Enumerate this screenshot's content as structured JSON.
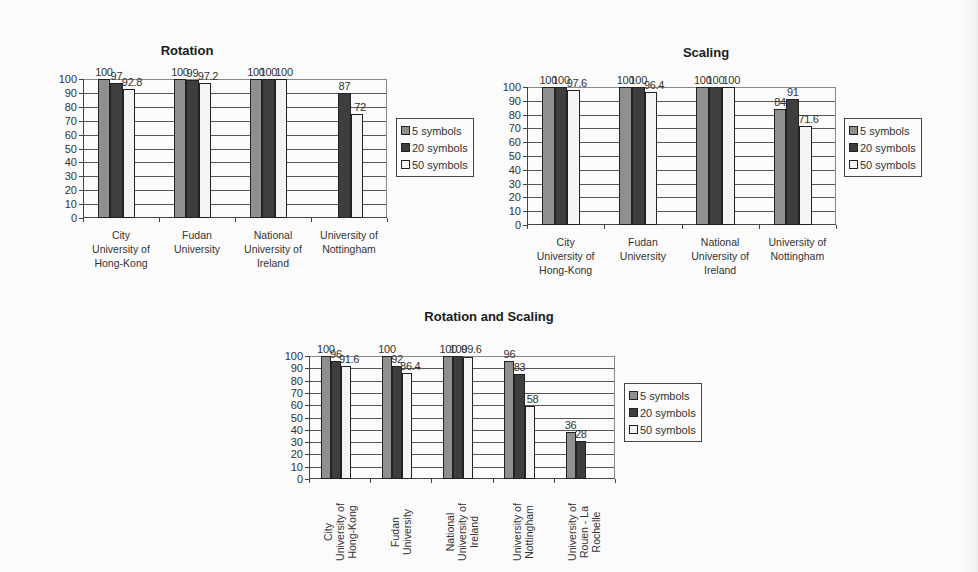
{
  "page": {
    "background": "#fbfbfb"
  },
  "series_colors": {
    "5 symbols": "#8f8f8f",
    "20 symbols": "#3e3e3e",
    "50 symbols": "#f4f4f4"
  },
  "chart_data": [
    {
      "id": "rotation",
      "type": "bar",
      "title": "Rotation",
      "xlabel": "",
      "ylabel": "",
      "ylim": [
        0,
        100
      ],
      "yticks": [
        0,
        10,
        20,
        30,
        40,
        50,
        60,
        70,
        80,
        90,
        100
      ],
      "grid": true,
      "legend_position": "right",
      "categories": [
        "City University of Hong-Kong",
        "Fudan University",
        "National University of Ireland",
        "University of Nottingham"
      ],
      "category_label_lines": [
        [
          "City",
          "University of",
          "Hong-Kong"
        ],
        [
          "Fudan",
          "University"
        ],
        [
          "National",
          "University of",
          "Ireland"
        ],
        [
          "University of",
          "Nottingham"
        ]
      ],
      "series": [
        {
          "name": "5 symbols",
          "values": [
            100,
            100,
            100,
            null
          ],
          "labels": [
            "100",
            "100",
            "100",
            ""
          ]
        },
        {
          "name": "20 symbols",
          "values": [
            97,
            99,
            100,
            90
          ],
          "labels": [
            "97",
            "99",
            "100",
            "87"
          ]
        },
        {
          "name": "50 symbols",
          "values": [
            92.8,
            97.2,
            100,
            75
          ],
          "labels": [
            "92.8",
            "97.2",
            "100",
            "72"
          ]
        }
      ],
      "layout": {
        "title_x": 187,
        "title_y": 43,
        "plot_left": 83,
        "plot_top": 79,
        "plot_width": 304,
        "plot_height": 139,
        "legend_left": 396,
        "legend_top": 118,
        "rotated_labels": false
      }
    },
    {
      "id": "scaling",
      "type": "bar",
      "title": "Scaling",
      "xlabel": "",
      "ylabel": "",
      "ylim": [
        0,
        100
      ],
      "yticks": [
        0,
        10,
        20,
        30,
        40,
        50,
        60,
        70,
        80,
        90,
        100
      ],
      "grid": true,
      "legend_position": "right",
      "categories": [
        "City University of Hong-Kong",
        "Fudan University",
        "National University of Ireland",
        "University of Nottingham"
      ],
      "category_label_lines": [
        [
          "City",
          "University of",
          "Hong-Kong"
        ],
        [
          "Fudan",
          "University"
        ],
        [
          "National",
          "University of",
          "Ireland"
        ],
        [
          "University of",
          "Nottingham"
        ]
      ],
      "series": [
        {
          "name": "5 symbols",
          "values": [
            100,
            100,
            100,
            84
          ],
          "labels": [
            "100",
            "100",
            "100",
            "84"
          ]
        },
        {
          "name": "20 symbols",
          "values": [
            100,
            100,
            100,
            91
          ],
          "labels": [
            "100",
            "100",
            "100",
            "91"
          ]
        },
        {
          "name": "50 symbols",
          "values": [
            97.6,
            96.4,
            100,
            71.6
          ],
          "labels": [
            "97.6",
            "96.4",
            "100",
            "71.6"
          ]
        }
      ],
      "layout": {
        "title_x": 706,
        "title_y": 45,
        "plot_left": 527,
        "plot_top": 87,
        "plot_width": 309,
        "plot_height": 138,
        "legend_left": 844,
        "legend_top": 118,
        "rotated_labels": false
      }
    },
    {
      "id": "rotation-and-scaling",
      "type": "bar",
      "title": "Rotation and Scaling",
      "xlabel": "",
      "ylabel": "",
      "ylim": [
        0,
        100
      ],
      "yticks": [
        0,
        10,
        20,
        30,
        40,
        50,
        60,
        70,
        80,
        90,
        100
      ],
      "grid": true,
      "legend_position": "right",
      "categories": [
        "City University of Hong-Kong",
        "Fudan University",
        "National University of Ireland",
        "University of Nottingham",
        "University of Rouen - La Rochelle"
      ],
      "category_label_lines": [
        [
          "City",
          "University of",
          "Hong-Kong"
        ],
        [
          "Fudan",
          "University"
        ],
        [
          "National",
          "University of",
          "Ireland"
        ],
        [
          "University of",
          "Nottingham"
        ],
        [
          "University of",
          "Rouen - La",
          "Rochelle"
        ]
      ],
      "series": [
        {
          "name": "5 symbols",
          "values": [
            100,
            100,
            100,
            96,
            38
          ],
          "labels": [
            "100",
            "100",
            "100",
            "96",
            "36"
          ]
        },
        {
          "name": "20 symbols",
          "values": [
            96,
            92,
            100,
            85,
            31
          ],
          "labels": [
            "96",
            "92",
            "100",
            "83",
            "28"
          ]
        },
        {
          "name": "50 symbols",
          "values": [
            91.6,
            86.4,
            99.6,
            59,
            null
          ],
          "labels": [
            "91.6",
            "86.4",
            "99.6",
            "58",
            ""
          ]
        }
      ],
      "layout": {
        "title_x": 489,
        "title_y": 309,
        "plot_left": 309,
        "plot_top": 356,
        "plot_width": 306,
        "plot_height": 123,
        "legend_left": 624,
        "legend_top": 383,
        "rotated_labels": true
      }
    }
  ]
}
